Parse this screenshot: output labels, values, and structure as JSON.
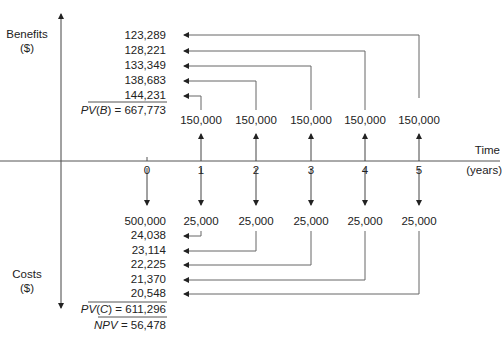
{
  "axes": {
    "benefits_label": "Benefits",
    "benefits_unit": "($)",
    "costs_label": "Costs",
    "costs_unit": "($)",
    "time_label": "Time",
    "time_unit": "(years)"
  },
  "time_ticks": [
    "0",
    "1",
    "2",
    "3",
    "4",
    "5"
  ],
  "benefits": {
    "nominal": [
      "150,000",
      "150,000",
      "150,000",
      "150,000",
      "150,000"
    ],
    "discounted": [
      "123,289",
      "128,221",
      "133,349",
      "138,683",
      "144,231"
    ],
    "pv_label_var": "PV",
    "pv_label_arg": "B",
    "pv_value": "= 667,773"
  },
  "costs": {
    "nominal": [
      "500,000",
      "25,000",
      "25,000",
      "25,000",
      "25,000",
      "25,000"
    ],
    "discounted": [
      "24,038",
      "23,114",
      "22,225",
      "21,370",
      "20,548"
    ],
    "pv_label_var": "PV",
    "pv_label_arg": "C",
    "pv_value": "= 611,296"
  },
  "npv": {
    "label": "NPV",
    "value": "= 56,478"
  },
  "colors": {
    "line": "#555555",
    "arrow": "#222222",
    "text": "#222222"
  }
}
